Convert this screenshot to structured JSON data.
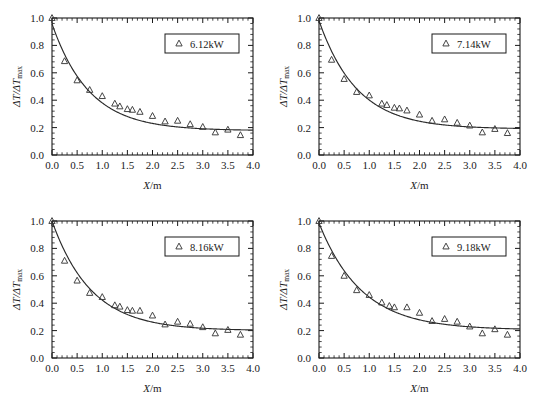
{
  "figure": {
    "panel_count": 4,
    "marker": "open-triangle",
    "curve_style": "solid-fit-line",
    "frame_color": "#1a1a1a",
    "marker_color": "#3a3a3a",
    "curve_color": "#2a2a2a"
  },
  "axes": {
    "x_label_prefix": "X",
    "x_label_suffix": "/m",
    "y_label": "ΔT/ΔTmax",
    "y_label_main": "ΔT/ΔT",
    "y_label_sub": "max",
    "x_ticks": [
      "0.0",
      "0.5",
      "1.0",
      "1.5",
      "2.0",
      "2.5",
      "3.0",
      "3.5",
      "4.0"
    ],
    "y_ticks": [
      "0.0",
      "0.2",
      "0.4",
      "0.6",
      "0.8",
      "1.0"
    ],
    "xlim": [
      0.0,
      4.0
    ],
    "ylim": [
      0.0,
      1.0
    ],
    "minor_ticks_per_interval": 5,
    "tick_direction": "in",
    "grid": false
  },
  "chart_data": [
    {
      "type": "scatter",
      "panel": 1,
      "title": "",
      "legend": "6.12kW",
      "legend_position": "top-right",
      "xlabel": "X/m",
      "ylabel": "ΔT/ΔTmax",
      "xlim": [
        0.0,
        4.0
      ],
      "ylim": [
        0.0,
        1.0
      ],
      "x": [
        0.0,
        0.25,
        0.5,
        0.75,
        1.0,
        1.25,
        1.35,
        1.5,
        1.6,
        1.75,
        2.0,
        2.25,
        2.5,
        2.75,
        3.0,
        3.25,
        3.5,
        3.75
      ],
      "values": [
        1.0,
        0.685,
        0.545,
        0.475,
        0.43,
        0.375,
        0.355,
        0.335,
        0.33,
        0.315,
        0.285,
        0.245,
        0.25,
        0.225,
        0.205,
        0.165,
        0.185,
        0.145
      ],
      "fit_curve": {
        "description": "exponential-decay fit",
        "a": 0.78,
        "b": 1.35,
        "c": 0.178,
        "formula": "y = a*exp(-b*x) + c"
      }
    },
    {
      "type": "scatter",
      "panel": 2,
      "title": "",
      "legend": "7.14kW",
      "legend_position": "top-right",
      "xlabel": "X/m",
      "ylabel": "ΔT/ΔTmax",
      "xlim": [
        0.0,
        4.0
      ],
      "ylim": [
        0.0,
        1.0
      ],
      "x": [
        0.0,
        0.25,
        0.5,
        0.75,
        1.0,
        1.25,
        1.35,
        1.5,
        1.6,
        1.75,
        2.0,
        2.25,
        2.5,
        2.75,
        3.0,
        3.25,
        3.5,
        3.75
      ],
      "values": [
        1.0,
        0.695,
        0.555,
        0.46,
        0.435,
        0.375,
        0.365,
        0.345,
        0.34,
        0.325,
        0.295,
        0.25,
        0.26,
        0.235,
        0.215,
        0.165,
        0.19,
        0.16
      ],
      "fit_curve": {
        "description": "exponential-decay fit",
        "a": 0.79,
        "b": 1.32,
        "c": 0.19,
        "formula": "y = a*exp(-b*x) + c"
      }
    },
    {
      "type": "scatter",
      "panel": 3,
      "title": "",
      "legend": "8.16kW",
      "legend_position": "top-right",
      "xlabel": "X/m",
      "ylabel": "ΔT/ΔTmax",
      "xlim": [
        0.0,
        4.0
      ],
      "ylim": [
        0.0,
        1.0
      ],
      "x": [
        0.0,
        0.25,
        0.5,
        0.75,
        1.0,
        1.25,
        1.35,
        1.5,
        1.6,
        1.75,
        2.0,
        2.25,
        2.5,
        2.75,
        3.0,
        3.25,
        3.5,
        3.75
      ],
      "values": [
        1.0,
        0.71,
        0.565,
        0.475,
        0.445,
        0.385,
        0.375,
        0.35,
        0.345,
        0.345,
        0.31,
        0.245,
        0.265,
        0.25,
        0.225,
        0.18,
        0.205,
        0.17
      ],
      "fit_curve": {
        "description": "exponential-decay fit",
        "a": 0.8,
        "b": 1.28,
        "c": 0.2,
        "formula": "y = a*exp(-b*x) + c"
      }
    },
    {
      "type": "scatter",
      "panel": 4,
      "title": "",
      "legend": "9.18kW",
      "legend_position": "top-right",
      "xlabel": "X/m",
      "ylabel": "ΔT/ΔTmax",
      "xlim": [
        0.0,
        4.0
      ],
      "ylim": [
        0.0,
        1.0
      ],
      "x": [
        0.0,
        0.25,
        0.5,
        0.75,
        1.0,
        1.25,
        1.4,
        1.5,
        1.75,
        2.0,
        2.25,
        2.5,
        2.75,
        3.0,
        3.25,
        3.5,
        3.75
      ],
      "values": [
        1.0,
        0.745,
        0.6,
        0.495,
        0.46,
        0.405,
        0.38,
        0.37,
        0.37,
        0.33,
        0.27,
        0.285,
        0.265,
        0.23,
        0.18,
        0.21,
        0.17
      ],
      "fit_curve": {
        "description": "exponential-decay fit",
        "a": 0.78,
        "b": 1.18,
        "c": 0.205,
        "formula": "y = a*exp(-b*x) + c"
      }
    }
  ]
}
